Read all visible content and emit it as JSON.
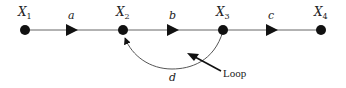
{
  "diagram": {
    "type": "signal-flow-graph",
    "colors": {
      "line": "#555555",
      "node": "#111111",
      "text": "#222222"
    },
    "nodes": [
      {
        "id": "X1",
        "label": "X",
        "sub": "1",
        "x": 25,
        "y": 30
      },
      {
        "id": "X2",
        "label": "X",
        "sub": "2",
        "x": 123,
        "y": 30
      },
      {
        "id": "X3",
        "label": "X",
        "sub": "3",
        "x": 223,
        "y": 30
      },
      {
        "id": "X4",
        "label": "X",
        "sub": "4",
        "x": 321,
        "y": 30
      }
    ],
    "edges": [
      {
        "from": "X1",
        "to": "X2",
        "label": "a"
      },
      {
        "from": "X2",
        "to": "X3",
        "label": "b"
      },
      {
        "from": "X3",
        "to": "X4",
        "label": "c"
      },
      {
        "from": "X3",
        "to": "X2",
        "label": "d",
        "curved": true
      }
    ],
    "annotation": {
      "text": "Loop"
    }
  }
}
